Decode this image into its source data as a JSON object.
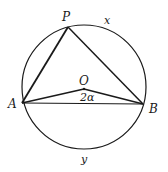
{
  "diagram": {
    "type": "inscribed-angle-circle",
    "points": {
      "P": {
        "label": "P",
        "x": 68,
        "y": 27
      },
      "A": {
        "label": "A",
        "x": 22,
        "y": 103
      },
      "B": {
        "label": "B",
        "x": 143,
        "y": 104
      },
      "O": {
        "label": "O",
        "x": 84,
        "y": 89
      }
    },
    "circle": {
      "cx": 84,
      "cy": 87,
      "r": 62
    },
    "arc_labels": {
      "upper": "x",
      "lower": "y"
    },
    "angle_label": "2α",
    "stroke_color": "#1a1a1a"
  }
}
